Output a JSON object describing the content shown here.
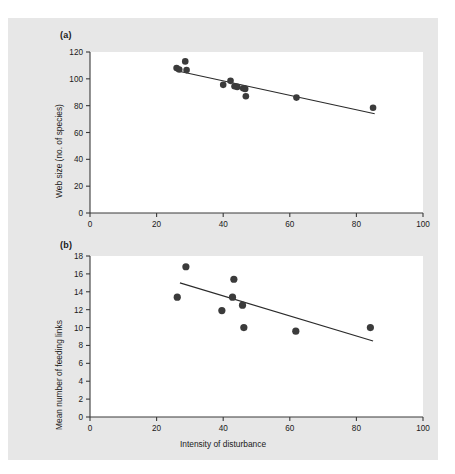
{
  "figure": {
    "background_color": "#e7e7e7",
    "plot_background_color": "#ffffff",
    "axis_color": "#3a3a3a",
    "marker_color": "#3b3b3b",
    "line_color": "#2b2b2b",
    "panel_a_label": "(a)",
    "panel_b_label": "(b)"
  },
  "chart_data": [
    {
      "type": "scatter",
      "panel": "(a)",
      "title": "",
      "xlabel": "",
      "ylabel": "Web size (no. of species)",
      "xlim": [
        0,
        100
      ],
      "ylim": [
        0,
        120
      ],
      "xticks": [
        0,
        20,
        40,
        60,
        80,
        100
      ],
      "yticks": [
        0,
        20,
        40,
        60,
        80,
        100,
        120
      ],
      "xtick_labels": [
        "0",
        "20",
        "40",
        "60",
        "80",
        "100"
      ],
      "ytick_labels": [
        "0",
        "20",
        "40",
        "60",
        "80",
        "100",
        "120"
      ],
      "grid": false,
      "legend": false,
      "points": [
        {
          "x": 26.0,
          "y": 108.0
        },
        {
          "x": 26.8,
          "y": 107.0
        },
        {
          "x": 28.6,
          "y": 113.0
        },
        {
          "x": 29.0,
          "y": 106.5
        },
        {
          "x": 40.0,
          "y": 95.5
        },
        {
          "x": 42.2,
          "y": 98.5
        },
        {
          "x": 43.4,
          "y": 94.5
        },
        {
          "x": 44.2,
          "y": 94.0
        },
        {
          "x": 46.0,
          "y": 93.0
        },
        {
          "x": 46.6,
          "y": 92.5
        },
        {
          "x": 46.8,
          "y": 87.0
        },
        {
          "x": 62.0,
          "y": 86.0
        },
        {
          "x": 85.0,
          "y": 78.5
        }
      ],
      "trendline": {
        "x0": 26.0,
        "y0": 106.0,
        "x1": 85.5,
        "y1": 74.0
      }
    },
    {
      "type": "scatter",
      "panel": "(b)",
      "title": "",
      "xlabel": "Intensity of disturbance",
      "ylabel": "Mean number of feeding links",
      "xlim": [
        0,
        100
      ],
      "ylim": [
        0,
        18
      ],
      "xticks": [
        0,
        20,
        40,
        60,
        80,
        100
      ],
      "yticks": [
        0,
        2,
        4,
        6,
        8,
        10,
        12,
        14,
        16,
        18
      ],
      "xtick_labels": [
        "0",
        "20",
        "40",
        "60",
        "80",
        "100"
      ],
      "ytick_labels": [
        "0",
        "2",
        "4",
        "6",
        "8",
        "10",
        "12",
        "14",
        "16",
        "18"
      ],
      "grid": false,
      "legend": false,
      "points": [
        {
          "x": 26.2,
          "y": 13.4
        },
        {
          "x": 28.8,
          "y": 16.8
        },
        {
          "x": 39.6,
          "y": 11.9
        },
        {
          "x": 42.8,
          "y": 13.4
        },
        {
          "x": 43.2,
          "y": 15.4
        },
        {
          "x": 45.8,
          "y": 12.5
        },
        {
          "x": 46.2,
          "y": 10.0
        },
        {
          "x": 61.8,
          "y": 9.6
        },
        {
          "x": 84.2,
          "y": 10.0
        }
      ],
      "trendline": {
        "x0": 27.0,
        "y0": 15.0,
        "x1": 85.0,
        "y1": 8.5
      }
    }
  ]
}
